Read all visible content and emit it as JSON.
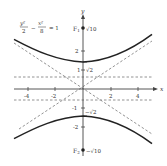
{
  "diagram": {
    "equation": {
      "lhs_num1": "y²",
      "lhs_den1": "2",
      "minus": "−",
      "lhs_num2": "x²",
      "lhs_den2": "8",
      "rhs": "= 1"
    },
    "axes": {
      "x_label": "x",
      "y_label": "y",
      "x_ticks": [
        {
          "value": -4,
          "label": "-4"
        },
        {
          "value": -2,
          "label": "-2"
        },
        {
          "value": 2,
          "label": "2"
        },
        {
          "value": 4,
          "label": "4"
        }
      ],
      "y_ticks": [
        {
          "value": 2,
          "label": "2"
        },
        {
          "value": 1,
          "label": "1"
        },
        {
          "value": -1,
          "label": "-1"
        },
        {
          "value": -2,
          "label": "-2"
        }
      ]
    },
    "annotations": {
      "f1_label": "F",
      "f1_sub": "1",
      "f1_value": "√10",
      "f2_label": "F",
      "f2_sub": "2",
      "f2_value": "−√10",
      "vertex_top": "√2",
      "vertex_bottom": "−√2"
    },
    "colors": {
      "curve": "#222222",
      "axis": "#444444",
      "dashed": "#777777"
    }
  }
}
